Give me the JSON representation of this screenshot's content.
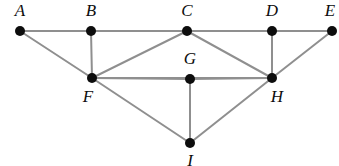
{
  "figure": {
    "background_color": "#ffffff",
    "edge_color": "#8f8f8f",
    "node_color": "#0d0d0d",
    "label_color": "#0d0d0d",
    "width": 339,
    "height": 166
  },
  "chart_data": {
    "type": "diagram",
    "graph_type": "undirected",
    "node_count": 9,
    "edge_count": 16,
    "nodes": [
      {
        "id": "A",
        "label": "A",
        "x": 20,
        "y": 31,
        "label_x": 20,
        "label_y": 16,
        "label_position": "above"
      },
      {
        "id": "B",
        "label": "B",
        "x": 91,
        "y": 31,
        "label_x": 91,
        "label_y": 16,
        "label_position": "above"
      },
      {
        "id": "C",
        "label": "C",
        "x": 187,
        "y": 31,
        "label_x": 187,
        "label_y": 16,
        "label_position": "above"
      },
      {
        "id": "D",
        "label": "D",
        "x": 272,
        "y": 31,
        "label_x": 272,
        "label_y": 16,
        "label_position": "above"
      },
      {
        "id": "E",
        "label": "E",
        "x": 332,
        "y": 31,
        "label_x": 330,
        "label_y": 16,
        "label_position": "above"
      },
      {
        "id": "F",
        "label": "F",
        "x": 92,
        "y": 78,
        "label_x": 88,
        "label_y": 102,
        "label_position": "below-left"
      },
      {
        "id": "G",
        "label": "G",
        "x": 190,
        "y": 79,
        "label_x": 190,
        "label_y": 64,
        "label_position": "above"
      },
      {
        "id": "H",
        "label": "H",
        "x": 272,
        "y": 78,
        "label_x": 277,
        "label_y": 102,
        "label_position": "below-right"
      },
      {
        "id": "I",
        "label": "I",
        "x": 190,
        "y": 143,
        "label_x": 190,
        "label_y": 166,
        "label_position": "below"
      }
    ],
    "edges": [
      {
        "from": "A",
        "to": "B"
      },
      {
        "from": "B",
        "to": "C"
      },
      {
        "from": "C",
        "to": "D"
      },
      {
        "from": "D",
        "to": "E"
      },
      {
        "from": "A",
        "to": "F"
      },
      {
        "from": "B",
        "to": "F"
      },
      {
        "from": "C",
        "to": "F"
      },
      {
        "from": "C",
        "to": "H"
      },
      {
        "from": "D",
        "to": "H"
      },
      {
        "from": "E",
        "to": "H"
      },
      {
        "from": "F",
        "to": "G"
      },
      {
        "from": "G",
        "to": "H"
      },
      {
        "from": "F",
        "to": "I"
      },
      {
        "from": "G",
        "to": "I"
      },
      {
        "from": "H",
        "to": "I"
      },
      {
        "from": "F",
        "to": "H"
      }
    ],
    "adjacency": {
      "A": [
        "B",
        "F"
      ],
      "B": [
        "A",
        "C",
        "F"
      ],
      "C": [
        "B",
        "D",
        "F",
        "H"
      ],
      "D": [
        "C",
        "E",
        "H"
      ],
      "E": [
        "D",
        "H"
      ],
      "F": [
        "A",
        "B",
        "C",
        "G",
        "H",
        "I"
      ],
      "G": [
        "F",
        "H",
        "I"
      ],
      "H": [
        "C",
        "D",
        "E",
        "F",
        "G",
        "I"
      ],
      "I": [
        "F",
        "G",
        "H"
      ]
    }
  }
}
